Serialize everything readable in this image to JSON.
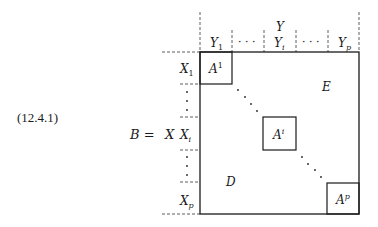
{
  "equation_number": "(12.4.1)",
  "lhs": "B =",
  "row_group_label": "X",
  "col_group_label": "Y",
  "col_labels": [
    {
      "base": "Y",
      "sub": "1"
    },
    {
      "base": "",
      "sub": "",
      "dots": "· · ·"
    },
    {
      "base": "Y",
      "sub": "i"
    },
    {
      "base": "",
      "sub": "",
      "dots": "· · ·"
    },
    {
      "base": "Y",
      "sub": "p"
    }
  ],
  "row_labels": [
    {
      "base": "X",
      "sub": "1"
    },
    {
      "base": "X",
      "sub": "i"
    },
    {
      "base": "X",
      "sub": "p"
    }
  ],
  "blocks": [
    {
      "base": "A",
      "sup": "1"
    },
    {
      "base": "A",
      "sup": "i"
    },
    {
      "base": "A",
      "sup": "p"
    }
  ],
  "upper_region": "E",
  "lower_region": "D",
  "colors": {
    "ink": "#1a1a1a",
    "background": "#ffffff"
  }
}
